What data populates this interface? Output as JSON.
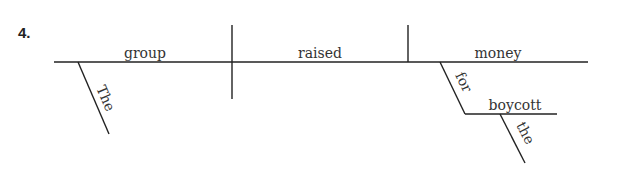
{
  "exercise": {
    "number": "4."
  },
  "diagram": {
    "subject": "group",
    "subject_modifier": "The",
    "verb": "raised",
    "direct_object": "money",
    "preposition": "for",
    "prepositional_object": "boycott",
    "prepositional_object_modifier": "the"
  },
  "colors": {
    "line": "#222222",
    "text": "#333333",
    "background": "#ffffff"
  }
}
